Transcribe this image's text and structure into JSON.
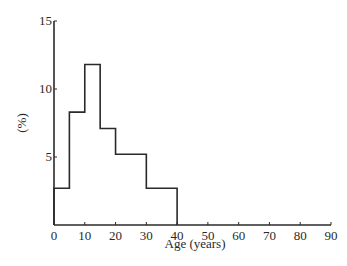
{
  "chart_data": {
    "type": "bar",
    "subtype": "histogram",
    "title": "",
    "xlabel": "Age (years)",
    "ylabel": "(%)",
    "xlim": [
      0,
      90
    ],
    "ylim": [
      0,
      15
    ],
    "x_ticks": [
      "0",
      "10",
      "20",
      "30",
      "40",
      "50",
      "60",
      "70",
      "80",
      "90"
    ],
    "y_ticks": [
      "5",
      "10",
      "15"
    ],
    "grid": false,
    "legend": null,
    "bins": [
      {
        "from": 0,
        "to": 5,
        "value": 2.7
      },
      {
        "from": 5,
        "to": 10,
        "value": 8.3
      },
      {
        "from": 10,
        "to": 15,
        "value": 11.8
      },
      {
        "from": 15,
        "to": 20,
        "value": 7.1
      },
      {
        "from": 20,
        "to": 30,
        "value": 5.2
      },
      {
        "from": 30,
        "to": 40,
        "value": 2.7
      }
    ],
    "categories": [
      "0-5",
      "5-10",
      "10-15",
      "15-20",
      "20-30",
      "30-40"
    ],
    "values": [
      2.7,
      8.3,
      11.8,
      7.1,
      5.2,
      2.7
    ]
  }
}
